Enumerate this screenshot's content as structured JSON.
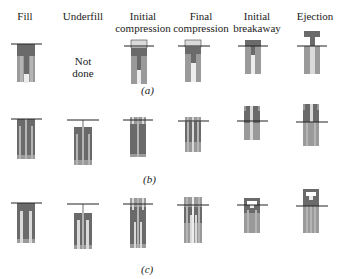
{
  "headers": [
    {
      "label": "Fill",
      "x": 25
    },
    {
      "label": "Underfill",
      "x": 83
    },
    {
      "label": "Initial compression",
      "x": 143
    },
    {
      "label": "Final compression",
      "x": 200
    },
    {
      "label": "Initial breakaway",
      "x": 257
    },
    {
      "label": "Ejection",
      "x": 315
    }
  ],
  "underfill_note": "Not done",
  "captions": {
    "a": "(a)",
    "b": "(b)",
    "c": "(c)"
  },
  "colors": {
    "die": "#9a9a9a",
    "powder": "#6a6a6a",
    "punch": "#d4d4d4",
    "line": "#222222",
    "upper_punch": "#dadada"
  }
}
